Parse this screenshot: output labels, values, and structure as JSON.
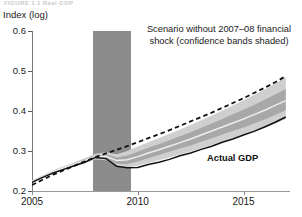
{
  "figure": {
    "title": "FIGURE 1.1  Real GDP",
    "y_axis_title": "Index (log)"
  },
  "annotations": {
    "scenario_note": "Scenario without 2007–08 financial shock (confidence bands shaded)",
    "actual_series_label": "Actual GDP"
  },
  "colors": {
    "recession_band": "#8c8c8c",
    "outer_band": "#cfcfcf",
    "inner_band": "#a8a8a8",
    "median_line": "#ededed",
    "actual_line": "#111111",
    "trend_line": "#111111",
    "axis": "#8a8a8a"
  },
  "chart_data": {
    "type": "line",
    "title": "FIGURE 1.1  Real GDP",
    "xlabel": "",
    "ylabel": "Index (log)",
    "xlim": [
      2005,
      2017.2
    ],
    "ylim": [
      0.2,
      0.6
    ],
    "grid": false,
    "legend_position": "inline-annotation",
    "x_ticks": [
      2005,
      2010,
      2015
    ],
    "y_ticks": [
      0.2,
      0.3,
      0.4,
      0.5,
      0.6
    ],
    "shaded_regions": [
      {
        "name": "2007-08 financial shock",
        "x_start": 2007.9,
        "x_end": 2009.7,
        "color": "#8c8c8c"
      }
    ],
    "x": [
      2005.0,
      2005.5,
      2006.0,
      2006.5,
      2007.0,
      2007.5,
      2008.0,
      2008.5,
      2009.0,
      2009.5,
      2010.0,
      2010.5,
      2011.0,
      2011.5,
      2012.0,
      2012.5,
      2013.0,
      2013.5,
      2014.0,
      2014.5,
      2015.0,
      2015.5,
      2016.0,
      2016.5,
      2017.0
    ],
    "series": [
      {
        "name": "Actual GDP",
        "style": "solid",
        "color": "#111111",
        "values": [
          0.222,
          0.234,
          0.245,
          0.254,
          0.263,
          0.272,
          0.284,
          0.281,
          0.262,
          0.258,
          0.259,
          0.266,
          0.272,
          0.279,
          0.288,
          0.295,
          0.304,
          0.312,
          0.322,
          0.33,
          0.34,
          0.349,
          0.36,
          0.372,
          0.385
        ]
      },
      {
        "name": "Scenario without 2007–08 financial shock (trend)",
        "style": "dashed",
        "color": "#111111",
        "values": [
          0.215,
          0.228,
          0.241,
          0.252,
          0.263,
          0.274,
          0.285,
          0.294,
          0.303,
          0.312,
          0.322,
          0.332,
          0.342,
          0.352,
          0.363,
          0.374,
          0.385,
          0.396,
          0.408,
          0.42,
          0.432,
          0.445,
          0.458,
          0.472,
          0.487
        ]
      },
      {
        "name": "Scenario median",
        "style": "solid-light",
        "color": "#ededed",
        "values": [
          0.224,
          0.237,
          0.249,
          0.258,
          0.267,
          0.276,
          0.286,
          0.287,
          0.276,
          0.278,
          0.286,
          0.295,
          0.303,
          0.312,
          0.321,
          0.33,
          0.34,
          0.35,
          0.36,
          0.37,
          0.38,
          0.391,
          0.402,
          0.414,
          0.426
        ]
      }
    ],
    "confidence_bands": [
      {
        "name": "outer band",
        "color": "#cfcfcf",
        "upper": [
          0.226,
          0.24,
          0.252,
          0.262,
          0.272,
          0.282,
          0.293,
          0.297,
          0.292,
          0.3,
          0.311,
          0.322,
          0.332,
          0.343,
          0.354,
          0.365,
          0.377,
          0.389,
          0.401,
          0.414,
          0.427,
          0.44,
          0.454,
          0.469,
          0.485
        ],
        "lower": [
          0.221,
          0.234,
          0.246,
          0.254,
          0.262,
          0.27,
          0.279,
          0.277,
          0.261,
          0.258,
          0.263,
          0.27,
          0.277,
          0.284,
          0.291,
          0.299,
          0.307,
          0.315,
          0.323,
          0.332,
          0.341,
          0.35,
          0.359,
          0.369,
          0.38
        ]
      },
      {
        "name": "inner band",
        "color": "#a8a8a8",
        "upper": [
          0.225,
          0.238,
          0.25,
          0.26,
          0.269,
          0.279,
          0.289,
          0.292,
          0.284,
          0.289,
          0.298,
          0.308,
          0.317,
          0.327,
          0.337,
          0.347,
          0.358,
          0.369,
          0.38,
          0.392,
          0.403,
          0.415,
          0.428,
          0.441,
          0.455
        ],
        "lower": [
          0.222,
          0.236,
          0.247,
          0.256,
          0.264,
          0.273,
          0.282,
          0.281,
          0.268,
          0.267,
          0.274,
          0.282,
          0.29,
          0.298,
          0.306,
          0.314,
          0.323,
          0.332,
          0.341,
          0.35,
          0.359,
          0.369,
          0.379,
          0.39,
          0.402
        ]
      }
    ]
  }
}
